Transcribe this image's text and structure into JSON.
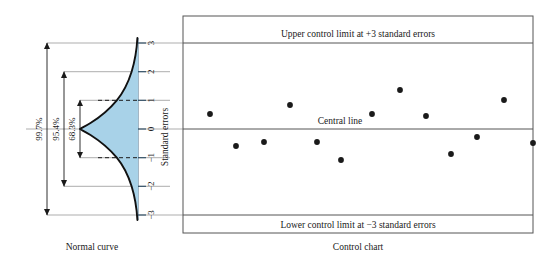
{
  "figure": {
    "left_caption": "Normal curve",
    "right_caption": "Control chart"
  },
  "normal_curve": {
    "axis_title": "Standard errors",
    "tick_labels": [
      "3",
      "2",
      "1",
      "0",
      "−1",
      "−2",
      "−3"
    ],
    "tick_values": [
      3,
      2,
      1,
      0,
      -1,
      -2,
      -3
    ],
    "bracket_labels": [
      "99.7%",
      "95.4%",
      "68.3%"
    ],
    "bracket_ranges": [
      [
        -3,
        3
      ],
      [
        -2,
        2
      ],
      [
        -1,
        1
      ]
    ],
    "fill_color": "#a8d2e8",
    "curve_color": "#1a1a1a"
  },
  "control_chart": {
    "upper_limit_label": "Upper control limit at +3 standard errors",
    "central_line_label": "Central line",
    "lower_limit_label": "Lower control limit at −3 standard errors",
    "upper_limit_value": 3,
    "central_line_value": 0,
    "lower_limit_value": -3,
    "point_color": "#1a1a1a",
    "border_color": "#555555"
  },
  "chart_data": {
    "type": "scatter",
    "title": "Control chart",
    "xlabel": "",
    "ylabel": "Standard errors",
    "ylim": [
      -3.6,
      3.6
    ],
    "xlim": [
      0,
      15
    ],
    "grid": false,
    "legend": "none",
    "reference_lines": [
      {
        "value": 3,
        "label": "Upper control limit at +3 standard errors"
      },
      {
        "value": 0,
        "label": "Central line"
      },
      {
        "value": -3,
        "label": "Lower control limit at −3 standard errors"
      }
    ],
    "series": [
      {
        "name": "Sample means",
        "x": [
          1,
          2,
          3,
          4,
          5,
          6,
          7,
          8,
          9,
          10,
          11,
          12,
          13,
          14
        ],
        "values": [
          0.53,
          -0.59,
          -0.45,
          0.84,
          -0.45,
          -0.99,
          0.53,
          1.36,
          0.45,
          -0.87,
          -0.28,
          0.99,
          -0.49,
          15.0
        ],
        "pixels": [
          {
            "x": 210,
            "y": 114
          },
          {
            "x": 236,
            "y": 146
          },
          {
            "x": 264,
            "y": 142
          },
          {
            "x": 290,
            "y": 105
          },
          {
            "x": 317,
            "y": 142
          },
          {
            "x": 341,
            "y": 160
          },
          {
            "x": 372,
            "y": 114
          },
          {
            "x": 400,
            "y": 90
          },
          {
            "x": 426,
            "y": 116
          },
          {
            "x": 451,
            "y": 154
          },
          {
            "x": 477,
            "y": 137
          },
          {
            "x": 504,
            "y": 100
          },
          {
            "x": 533,
            "y": 143
          }
        ]
      }
    ]
  }
}
